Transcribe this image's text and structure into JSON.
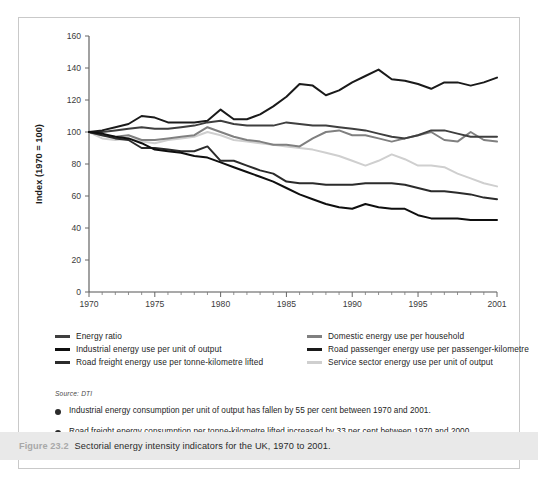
{
  "chart_data": {
    "type": "line",
    "title": "",
    "xlabel": "",
    "ylabel": "Index (1970 = 100)",
    "xlim": [
      1970,
      2001
    ],
    "ylim": [
      0,
      160
    ],
    "ytick_labels": [
      "0",
      "20",
      "40",
      "60",
      "80",
      "100",
      "120",
      "140",
      "160"
    ],
    "ytick_values": [
      0,
      20,
      40,
      60,
      80,
      100,
      120,
      140,
      160
    ],
    "xtick_labels": [
      "1970",
      "1975",
      "1980",
      "1985",
      "1990",
      "1995",
      "2001"
    ],
    "xtick_values": [
      1970,
      1975,
      1980,
      1985,
      1990,
      1995,
      2001
    ],
    "grid": false,
    "legend_position": "below-plot",
    "x": [
      1970,
      1971,
      1972,
      1973,
      1974,
      1975,
      1976,
      1977,
      1978,
      1979,
      1980,
      1981,
      1982,
      1983,
      1984,
      1985,
      1986,
      1987,
      1988,
      1989,
      1990,
      1991,
      1992,
      1993,
      1994,
      1995,
      1996,
      1997,
      1998,
      1999,
      2000,
      2001
    ],
    "series": [
      {
        "name": "Road passenger energy use per passenger-kilometre",
        "color": "#1a1a1a",
        "values": [
          100,
          101,
          103,
          105,
          110,
          109,
          106,
          106,
          106,
          107,
          114,
          108,
          108,
          111,
          116,
          122,
          130,
          129,
          123,
          126,
          131,
          135,
          139,
          133,
          132,
          130,
          127,
          131,
          131,
          129,
          131,
          134
        ]
      },
      {
        "name": "Energy ratio",
        "color": "#3f3f3f",
        "values": [
          100,
          100,
          101,
          102,
          103,
          102,
          102,
          103,
          104,
          106,
          107,
          105,
          104,
          104,
          104,
          106,
          105,
          104,
          104,
          103,
          102,
          101,
          99,
          97,
          96,
          98,
          101,
          101,
          99,
          97,
          97,
          97
        ]
      },
      {
        "name": "Domestic energy use per household",
        "color": "#808080",
        "values": [
          100,
          98,
          97,
          98,
          95,
          95,
          96,
          97,
          98,
          103,
          100,
          97,
          95,
          94,
          92,
          92,
          91,
          96,
          100,
          101,
          98,
          98,
          96,
          94,
          96,
          98,
          100,
          95,
          94,
          100,
          95,
          94
        ]
      },
      {
        "name": "Service sector energy use per unit of output",
        "color": "#cfcfcf",
        "values": [
          100,
          96,
          95,
          96,
          94,
          93,
          95,
          96,
          97,
          100,
          98,
          95,
          94,
          93,
          92,
          91,
          90,
          89,
          87,
          85,
          82,
          79,
          82,
          86,
          83,
          79,
          79,
          78,
          74,
          71,
          68,
          66
        ]
      },
      {
        "name": "Road freight energy use per tonne-kilometre lifted",
        "color": "#2b2b2b",
        "values": [
          100,
          98,
          96,
          95,
          90,
          90,
          89,
          88,
          88,
          91,
          82,
          82,
          79,
          76,
          74,
          69,
          68,
          68,
          67,
          67,
          67,
          68,
          68,
          68,
          67,
          65,
          63,
          63,
          62,
          61,
          59,
          58
        ]
      },
      {
        "name": "Industrial energy use per unit of output",
        "color": "#0f0f0f",
        "values": [
          100,
          99,
          97,
          96,
          93,
          89,
          88,
          87,
          85,
          84,
          81,
          78,
          75,
          72,
          69,
          65,
          61,
          58,
          55,
          53,
          52,
          55,
          53,
          52,
          52,
          48,
          46,
          46,
          46,
          45,
          45,
          45
        ]
      }
    ]
  },
  "legend": {
    "items": [
      {
        "label": "Energy ratio",
        "color": "#3f3f3f",
        "column": "left"
      },
      {
        "label": "Industrial energy use per unit of output",
        "color": "#0f0f0f",
        "column": "left"
      },
      {
        "label": "Road freight energy use per tonne-kilometre lifted",
        "color": "#2b2b2b",
        "column": "left"
      },
      {
        "label": "Domestic energy use per household",
        "color": "#808080",
        "column": "right"
      },
      {
        "label": "Road passenger energy use per passenger-kilometre",
        "color": "#1a1a1a",
        "column": "right"
      },
      {
        "label": "Service sector energy use per unit of output",
        "color": "#cfcfcf",
        "column": "right"
      }
    ]
  },
  "source": {
    "text": "Source: DTI"
  },
  "bullets": [
    {
      "text": "Industrial energy consumption per unit of output has fallen by 55 per cent between 1970 and 2001."
    },
    {
      "text": "Road freight energy consumption per tonne-kilometre lifted increased by 33 per cent between 1970 and 2000."
    }
  ],
  "caption": {
    "figure_number": "Figure 23.2",
    "text": "Sectorial energy intensity indicators for the UK, 1970 to 2001."
  }
}
